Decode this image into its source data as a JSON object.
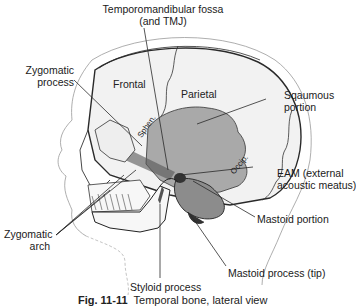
{
  "figure": {
    "caption_number": "Fig. 11-11",
    "caption_text": "Temporal bone, lateral view"
  },
  "labels": {
    "tmj_line1": "Temporomandibular fossa",
    "tmj_line2": "(and TMJ)",
    "zyg_process_line1": "Zygomatic",
    "zyg_process_line2": "process",
    "squamous_line1": "Sqaumous",
    "squamous_line2": "portion",
    "eam_line1": "EAM (external",
    "eam_line2": "acoustic meatus)",
    "mastoid_portion": "Mastoid portion",
    "zyg_arch_line1": "Zygomatic",
    "zyg_arch_line2": "arch",
    "styloid": "Styloid process",
    "mastoid_tip": "Mastoid process (tip)"
  },
  "regions": {
    "frontal": "Frontal",
    "parietal": "Parietal",
    "sphen": "Sphen.",
    "occip": "Occip."
  },
  "colors": {
    "temporal_fill": "#a9a9a9",
    "bone_fill": "#f2f2f2",
    "line": "#2a2a2a"
  }
}
